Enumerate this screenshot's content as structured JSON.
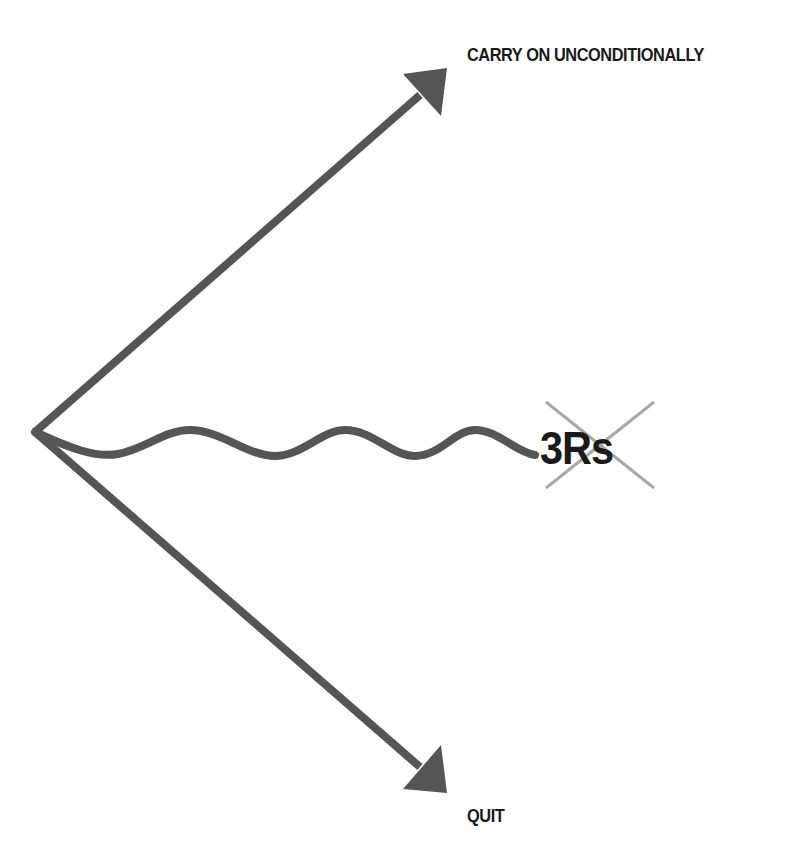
{
  "diagram": {
    "type": "branching-arrows",
    "colors": {
      "arrow": "#555555",
      "cross": "#a8a8a8",
      "text": "#1a1a1a",
      "background": "#ffffff"
    },
    "branches": [
      {
        "id": "top",
        "label": "CARRY ON UNCONDITIONALLY",
        "shape": "straight-arrow"
      },
      {
        "id": "middle",
        "label": "3Rs",
        "shape": "wavy-line",
        "crossed_out": true
      },
      {
        "id": "bottom",
        "label": "QUIT",
        "shape": "straight-arrow"
      }
    ]
  }
}
